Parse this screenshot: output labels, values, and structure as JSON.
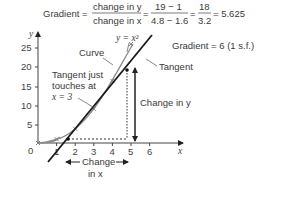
{
  "formula": {
    "prefix": "Gradient =",
    "frac1_num": "change in y",
    "frac1_den": "change in x",
    "frac2_num": "19 − 1",
    "frac2_den": "4.8 − 1.6",
    "frac3_num": "18",
    "frac3_den": "3.2",
    "result": "= 5.625"
  },
  "gradient_note": "Gradient = 6 (1 s.f.)",
  "labels": {
    "curve": "Curve",
    "curve_eq": "y = x²",
    "tangent": "Tangent",
    "tangent_note_1": "Tangent just",
    "tangent_note_2": "touches at",
    "tangent_note_3": "x = 3",
    "change_y": "Change in y",
    "change_x_1": "Change",
    "change_x_2": "in x"
  },
  "axes": {
    "x_label": "x",
    "y_label": "y",
    "origin": "0",
    "x_ticks": [
      "1",
      "2",
      "3",
      "4",
      "5",
      "6"
    ],
    "y_ticks": [
      "5",
      "10",
      "15",
      "20",
      "25"
    ]
  },
  "colors": {
    "curve": "#8a8a8a",
    "tangent": "#1a1a1a",
    "axes": "#444444"
  }
}
